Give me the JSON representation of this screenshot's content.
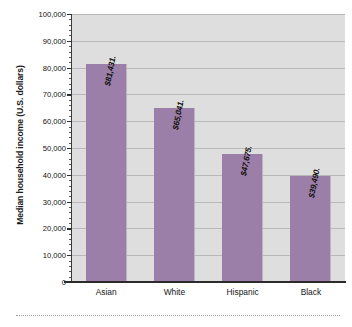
{
  "chart_data": {
    "type": "bar",
    "title": "",
    "subtitle": "",
    "xlabel": "",
    "ylabel": "Median household income (U.S. dollars)",
    "categories": [
      "Asian",
      "White",
      "Hispanic",
      "Black"
    ],
    "values": [
      81431,
      65041,
      47675,
      39490
    ],
    "value_labels": [
      "$81,431.",
      "$65,041.",
      "$47,675.",
      "$39,490."
    ],
    "ylim": [
      0,
      100000
    ],
    "ytick_step": 10000,
    "ytick_labels": [
      "0",
      "10,000",
      "20,000",
      "30,000",
      "40,000",
      "50,000",
      "60,000",
      "70,000",
      "80,000",
      "90,000",
      "100,000"
    ],
    "ytick_values": [
      0,
      10000,
      20000,
      30000,
      40000,
      50000,
      60000,
      70000,
      80000,
      90000,
      100000
    ],
    "minor_ticks_per_major": 5,
    "grid": "horizontal",
    "legend": "none",
    "series": [
      {
        "name": "Median household income",
        "values": [
          81431,
          65041,
          47675,
          39490
        ]
      }
    ]
  },
  "style": {
    "bar_color": "#9b7fa8",
    "plot_background": "#dedede",
    "gridline_color": "#b9b9b9",
    "axis_color": "#2b2b2b",
    "figure_background": "#ffffff",
    "label_text_color": "#14110f"
  }
}
